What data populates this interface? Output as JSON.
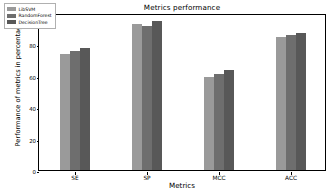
{
  "chart_data": {
    "type": "bar",
    "title": "Metrics performance",
    "xlabel": "Metrics",
    "ylabel": "Performance of metrics in percentage",
    "categories": [
      "SE",
      "SP",
      "MCC",
      "ACC"
    ],
    "series": [
      {
        "name": "LibSVM",
        "color": "#9a9a9a",
        "values": [
          74,
          93,
          59,
          85
        ]
      },
      {
        "name": "RandomForest",
        "color": "#6e6e6e",
        "values": [
          76,
          92,
          61,
          86
        ]
      },
      {
        "name": "DecisionTree",
        "color": "#585858",
        "values": [
          78,
          95,
          64,
          87
        ]
      }
    ],
    "ylim": [
      0,
      100
    ],
    "yticks": [
      0,
      20,
      40,
      60,
      80
    ],
    "ytick_labels": [
      "0",
      "20",
      "40",
      "60",
      "80"
    ],
    "grid": false,
    "legend_position": "upper-left",
    "edge_color": "#000000",
    "background_color": "#ffffff"
  }
}
